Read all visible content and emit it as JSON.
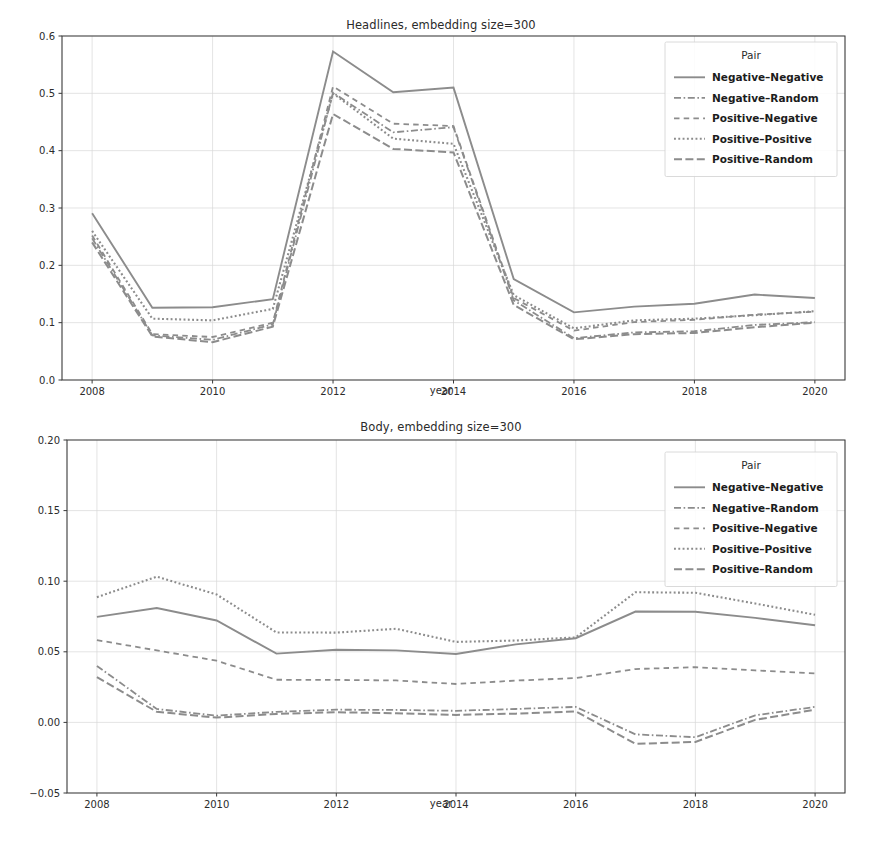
{
  "figure": {
    "width": 882,
    "height": 844,
    "background": "#ffffff",
    "line_color": "#8c8c8c",
    "grid_color": "#d9d9d9",
    "axis_color": "#3a3a3a"
  },
  "legend": {
    "title": "Pair",
    "position": "upper right",
    "entries": [
      {
        "label": "Negative–Negative",
        "style": "solid"
      },
      {
        "label": "Negative–Random",
        "style": "dashdot-fine"
      },
      {
        "label": "Positive–Negative",
        "style": "dashed-long"
      },
      {
        "label": "Positive–Positive",
        "style": "dotted"
      },
      {
        "label": "Positive–Random",
        "style": "dashed-medium"
      }
    ]
  },
  "chart_data": [
    {
      "id": "headlines",
      "type": "line",
      "title": "Headlines, embedding size=300",
      "xlabel": "year",
      "ylabel": "",
      "xlim": [
        2007.5,
        2020.5
      ],
      "ylim": [
        0.0,
        0.6
      ],
      "xticks": [
        2008,
        2010,
        2012,
        2014,
        2016,
        2018,
        2020
      ],
      "xticklabels": [
        "2008",
        "2010",
        "2012",
        "2014",
        "2016",
        "2018",
        "2020"
      ],
      "yticks": [
        0.0,
        0.1,
        0.2,
        0.3,
        0.4,
        0.5,
        0.6
      ],
      "yticklabels": [
        "0.0",
        "0.1",
        "0.2",
        "0.3",
        "0.4",
        "0.5",
        "0.6"
      ],
      "grid": true,
      "legend_title": "Pair",
      "x": [
        2008,
        2009,
        2010,
        2011,
        2012,
        2013,
        2014,
        2015,
        2016,
        2017,
        2018,
        2019,
        2020
      ],
      "series": [
        {
          "name": "Negative–Negative",
          "style": "solid",
          "values": [
            0.291,
            0.126,
            0.127,
            0.141,
            0.573,
            0.502,
            0.51,
            0.176,
            0.118,
            0.128,
            0.133,
            0.149,
            0.143
          ]
        },
        {
          "name": "Negative–Random",
          "style": "dashdot-fine",
          "values": [
            0.247,
            0.078,
            0.07,
            0.097,
            0.501,
            0.432,
            0.441,
            0.139,
            0.073,
            0.083,
            0.085,
            0.096,
            0.101
          ]
        },
        {
          "name": "Positive–Negative",
          "style": "dashed-long",
          "values": [
            0.252,
            0.08,
            0.075,
            0.1,
            0.512,
            0.447,
            0.443,
            0.143,
            0.086,
            0.101,
            0.105,
            0.114,
            0.119
          ]
        },
        {
          "name": "Positive–Positive",
          "style": "dotted",
          "values": [
            0.26,
            0.107,
            0.104,
            0.124,
            0.5,
            0.421,
            0.412,
            0.148,
            0.09,
            0.104,
            0.107,
            0.113,
            0.12
          ]
        },
        {
          "name": "Positive–Random",
          "style": "dashed-medium",
          "values": [
            0.24,
            0.076,
            0.066,
            0.093,
            0.464,
            0.403,
            0.397,
            0.131,
            0.071,
            0.08,
            0.082,
            0.092,
            0.1
          ]
        }
      ]
    },
    {
      "id": "body",
      "type": "line",
      "title": "Body, embedding size=300",
      "xlabel": "year",
      "ylabel": "",
      "xlim": [
        2007.5,
        2020.5
      ],
      "ylim": [
        -0.05,
        0.2
      ],
      "xticks": [
        2008,
        2010,
        2012,
        2014,
        2016,
        2018,
        2020
      ],
      "xticklabels": [
        "2008",
        "2010",
        "2012",
        "2014",
        "2016",
        "2018",
        "2020"
      ],
      "yticks": [
        -0.05,
        0.0,
        0.05,
        0.1,
        0.15,
        0.2
      ],
      "yticklabels": [
        "−0.05",
        "0.00",
        "0.05",
        "0.10",
        "0.15",
        "0.20"
      ],
      "grid": true,
      "legend_title": "Pair",
      "x": [
        2008,
        2009,
        2010,
        2011,
        2012,
        2013,
        2014,
        2015,
        2016,
        2017,
        2018,
        2019,
        2020
      ],
      "series": [
        {
          "name": "Negative–Negative",
          "style": "solid",
          "values": [
            0.0747,
            0.081,
            0.0722,
            0.0487,
            0.0514,
            0.051,
            0.0484,
            0.0553,
            0.0596,
            0.0785,
            0.0784,
            0.074,
            0.0688
          ]
        },
        {
          "name": "Negative–Random",
          "style": "dashdot-fine",
          "values": [
            0.04,
            0.0095,
            0.0048,
            0.0075,
            0.009,
            0.0088,
            0.0082,
            0.0095,
            0.011,
            -0.0085,
            -0.0105,
            0.005,
            0.011
          ]
        },
        {
          "name": "Positive–Negative",
          "style": "dashed-long",
          "values": [
            0.0583,
            0.051,
            0.0437,
            0.0302,
            0.0301,
            0.0297,
            0.0272,
            0.0296,
            0.0314,
            0.0378,
            0.0391,
            0.0368,
            0.0347
          ]
        },
        {
          "name": "Positive–Positive",
          "style": "dotted",
          "values": [
            0.0887,
            0.1032,
            0.0906,
            0.0637,
            0.0636,
            0.0663,
            0.057,
            0.058,
            0.0602,
            0.0922,
            0.0918,
            0.0842,
            0.0762
          ]
        },
        {
          "name": "Positive–Random",
          "style": "dashed-medium",
          "values": [
            0.032,
            0.0075,
            0.0034,
            0.006,
            0.0072,
            0.0065,
            0.0053,
            0.0062,
            0.0078,
            -0.0152,
            -0.0138,
            0.0018,
            0.009
          ]
        }
      ]
    }
  ]
}
